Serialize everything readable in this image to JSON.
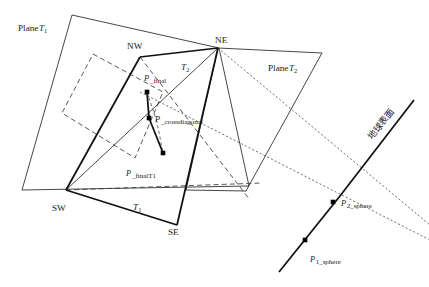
{
  "figure": {
    "type": "geometric-diagram",
    "width": 429,
    "height": 287,
    "background_color": "#ffffff",
    "line_color": "#1a1a1a"
  },
  "labels": {
    "plane_t1": {
      "text": "Plane",
      "sym": "T",
      "sub": "1",
      "x": 18,
      "y": 31
    },
    "plane_t2": {
      "text": "Plane",
      "sym": "T",
      "sub": "2",
      "x": 268,
      "y": 71
    },
    "corner_nw": {
      "text": "NW",
      "x": 127,
      "y": 49
    },
    "corner_ne": {
      "text": "NE",
      "x": 215,
      "y": 43
    },
    "corner_sw": {
      "text": "SW",
      "x": 52,
      "y": 211
    },
    "corner_se": {
      "text": "SE",
      "x": 168,
      "y": 235
    },
    "tri_t1": {
      "sym": "T",
      "sub": "1",
      "x": 133,
      "y": 210
    },
    "tri_t2": {
      "sym": "T",
      "sub": "2",
      "x": 181,
      "y": 70
    },
    "p_final": {
      "sym": "P",
      "sub": "_final",
      "x": 144,
      "y": 81
    },
    "p_crossdiagonal": {
      "sym": "P",
      "sub": "_crossdiagonal",
      "x": 155,
      "y": 122
    },
    "p_finalt1": {
      "sym": "P",
      "sub": "_finalT1",
      "x": 126,
      "y": 176
    },
    "p1_sphere": {
      "sym": "P",
      "sub": "1_sphere",
      "x": 310,
      "y": 262
    },
    "p2_sphere": {
      "sym": "P",
      "sub": "2_sphere",
      "x": 341,
      "y": 206
    },
    "earth_surface": {
      "text": "地球表面",
      "x": 372,
      "y": 140,
      "rotation": -52
    }
  },
  "geometry": {
    "plane_t1_outline": "72,15 219,48 249,186 22,190",
    "plane_t2_outline": "218,48 322,53 246,191 186,190",
    "quad_bold": "140,57 218,48 177,225 66,190",
    "dashed_parallelogram": "93,54 163,92 135,158 62,113",
    "sw_to_nw": "66,190 140,57",
    "sw_to_ne": "66,190 218,48",
    "se_to_ne": "177,225 218,48",
    "sw_to_se_bold": "66,190 177,225",
    "sw_dash_right": "66,190 262,183",
    "nw_dash_down": "140,57 250,200",
    "dot_ne_down": "218,48 430,225",
    "dot_diag_left": "140,92 430,240",
    "earth_curve": "279,272 340,196 414,100"
  },
  "points": [
    {
      "name": "P_final",
      "x": 147,
      "y": 92,
      "size": 4.6
    },
    {
      "name": "P_crossdiagonal",
      "x": 149,
      "y": 118,
      "size": 4.6
    },
    {
      "name": "P_finalT1",
      "x": 163,
      "y": 153,
      "size": 4.6
    },
    {
      "name": "P_2_sphere",
      "x": 333,
      "y": 202,
      "size": 4.6
    },
    {
      "name": "P_1_sphere",
      "x": 305,
      "y": 240,
      "size": 4.6
    }
  ],
  "connectors": {
    "final_to_cross": "147,92 149,118",
    "cross_to_finalt1": "149,118 163,153",
    "dashed_arc": "147,92 157,122 163,153"
  }
}
